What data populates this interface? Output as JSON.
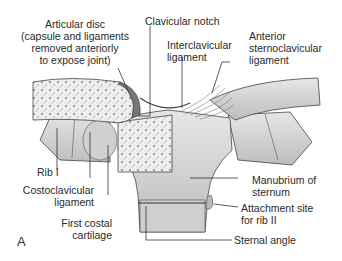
{
  "figure": {
    "letter": "A",
    "labels": {
      "articular_disc": [
        "Articular disc",
        "(capsule and ligaments",
        "removed anteriorly",
        "to  expose joint)"
      ],
      "clavicular_notch": "Clavicular notch",
      "interclavicular_ligament": [
        "Interclavicular",
        "ligament"
      ],
      "anterior_sternoclavicular_ligament": [
        "Anterior",
        "sternoclavicular",
        "ligament"
      ],
      "rib_i": "Rib I",
      "costoclavicular_ligament": [
        "Costoclavicular",
        "ligament"
      ],
      "first_costal_cartilage": [
        "First costal",
        "cartilage"
      ],
      "manubrium": [
        "Manubrium of",
        "sternum"
      ],
      "attachment_site": [
        "Attachment site",
        "for rib II"
      ],
      "sternal_angle": "Sternal angle"
    },
    "colors": {
      "bone": "#d9d9d9",
      "bone_dark": "#a8a8a8",
      "cancellous": "#ececec",
      "outline": "#3a3a3a",
      "leader": "#333333"
    }
  }
}
